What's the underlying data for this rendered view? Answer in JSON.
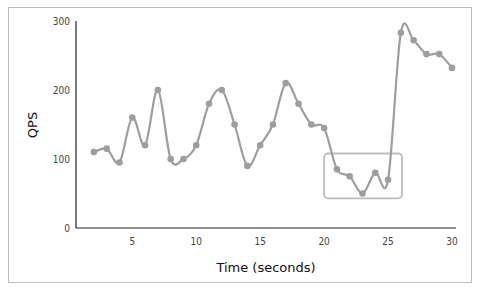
{
  "chart_data": {
    "type": "line",
    "title": "",
    "xlabel": "Time (seconds)",
    "ylabel": "QPS",
    "xlim": [
      0.6,
      30
    ],
    "ylim": [
      0,
      300
    ],
    "x_ticks": [
      5,
      10,
      15,
      20,
      25,
      30
    ],
    "y_ticks": [
      0,
      100,
      200,
      300
    ],
    "grid": false,
    "legend": null,
    "x": [
      2,
      3,
      4,
      5,
      6,
      7,
      8,
      9,
      10,
      11,
      12,
      13,
      14,
      15,
      16,
      17,
      18,
      19,
      20,
      21,
      22,
      23,
      24,
      25,
      26,
      27,
      28,
      29,
      30
    ],
    "series": [
      {
        "name": "QPS",
        "color": "#9e9e9e",
        "values": [
          110,
          115,
          95,
          160,
          120,
          200,
          100,
          100,
          120,
          180,
          200,
          150,
          90,
          120,
          150,
          210,
          180,
          150,
          145,
          85,
          75,
          50,
          80,
          70,
          283,
          272,
          252,
          252,
          232
        ]
      }
    ],
    "annotations": [
      {
        "type": "rectangle",
        "x_range": [
          20.0,
          26.1
        ],
        "y_range": [
          43,
          108
        ],
        "color": "#bdbdbd",
        "note": "highlight dip before spike"
      }
    ]
  }
}
